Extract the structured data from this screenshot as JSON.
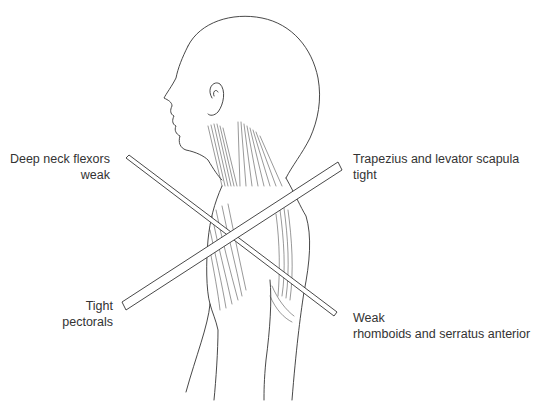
{
  "figure": {
    "colors": {
      "line": "#333333",
      "text": "#333333",
      "background": "#ffffff"
    }
  },
  "labels": {
    "top_left": {
      "line1": "Deep neck flexors",
      "line2": "weak"
    },
    "top_right": {
      "line1": "Trapezius and levator scapula",
      "line2": "tight"
    },
    "bottom_left": {
      "line1": "Tight",
      "line2": "pectorals"
    },
    "bottom_right": {
      "line1": "Weak",
      "line2": "rhomboids and serratus anterior"
    }
  }
}
